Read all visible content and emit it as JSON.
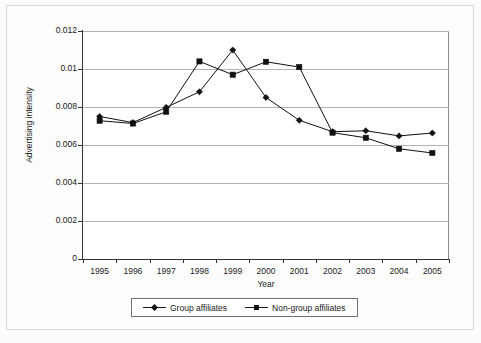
{
  "chart_data": {
    "type": "line",
    "title": "",
    "xlabel": "Year",
    "ylabel": "Advertising intensity",
    "x": [
      "1995",
      "1996",
      "1997",
      "1998",
      "1999",
      "2000",
      "2001",
      "2002",
      "2003",
      "2004",
      "2005"
    ],
    "categories": [
      "1995",
      "1996",
      "1997",
      "1998",
      "1999",
      "2000",
      "2001",
      "2002",
      "2003",
      "2004",
      "2005"
    ],
    "ylim": [
      0,
      0.012
    ],
    "yticks": [
      "0",
      "0.002",
      "0.004",
      "0.006",
      "0.008",
      "0.01",
      "0.012"
    ],
    "ytick_values": [
      0,
      0.002,
      0.004,
      0.006,
      0.008,
      0.01,
      0.012
    ],
    "grid": "horizontal",
    "legend_position": "bottom",
    "series": [
      {
        "name": "Group affiliates",
        "marker": "diamond",
        "color": "#111111",
        "values": [
          0.0075,
          0.00718,
          0.00798,
          0.0088,
          0.011,
          0.0085,
          0.0073,
          0.0067,
          0.00675,
          0.00648,
          0.00663
        ]
      },
      {
        "name": "Non-group affiliates",
        "marker": "square",
        "color": "#111111",
        "values": [
          0.00728,
          0.00713,
          0.00775,
          0.0104,
          0.0097,
          0.01038,
          0.0101,
          0.00665,
          0.00638,
          0.0058,
          0.00558
        ]
      }
    ]
  },
  "legend": {
    "items": [
      {
        "label": "Group affiliates",
        "marker": "diamond"
      },
      {
        "label": "Non-group affiliates",
        "marker": "square"
      }
    ]
  },
  "axes": {
    "x_title": "Year",
    "y_title": "Advertising intensity"
  }
}
